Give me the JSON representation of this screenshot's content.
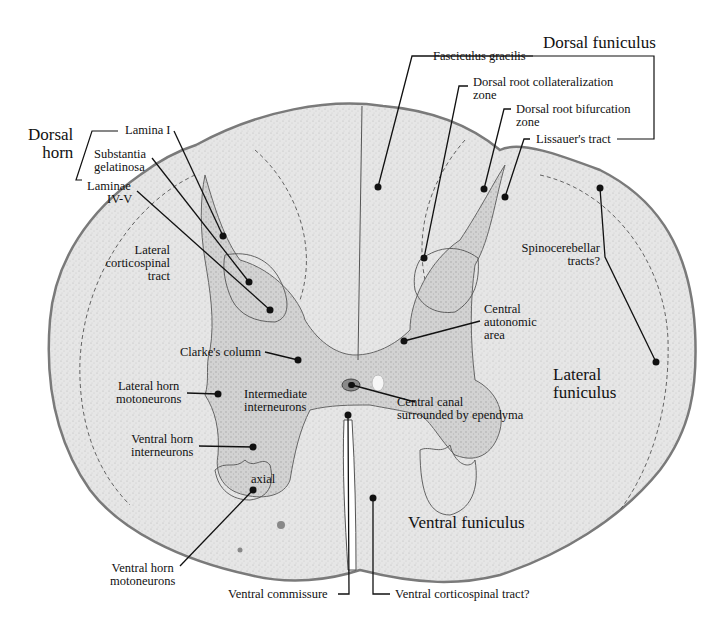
{
  "figure": {
    "type": "labeled histology diagram",
    "colors": {
      "tissue": "#e4e4e4",
      "tissue_edge": "#8a8a8a",
      "gray_matter": "#cfcfcf",
      "line": "#111111",
      "background": "#ffffff"
    }
  },
  "groups": {
    "dorsal_horn": [
      "Dorsal",
      "horn"
    ],
    "dorsal_funiculus": "Dorsal funiculus",
    "lateral_funiculus": [
      "Lateral",
      "funiculus"
    ],
    "ventral_funiculus": "Ventral funiculus"
  },
  "labels": {
    "lamina_i": "Lamina I",
    "substantia_gelatinosa": [
      "Substantia",
      "gelatinosa"
    ],
    "laminae_iv_v": [
      "Laminae",
      "IV-V"
    ],
    "lateral_corticospinal_tract": [
      "Lateral",
      "corticospinal",
      "tract"
    ],
    "fasciculus_gracilis": "Fasciculus gracilis",
    "dorsal_root_collateralization_zone": [
      "Dorsal root collateralization",
      "zone"
    ],
    "dorsal_root_bifurcation_zone": [
      "Dorsal root bifurcation",
      "zone"
    ],
    "lissauers_tract": "Lissauer's tract",
    "spinocerebellar_tracts": [
      "Spinocerebellar",
      "tracts?"
    ],
    "central_autonomic_area": [
      "Central",
      "autonomic",
      "area"
    ],
    "clarkes_column": "Clarke's column",
    "lateral_horn_motoneurons": [
      "Lateral horn",
      "motoneurons"
    ],
    "intermediate_interneurons": [
      "Intermediate",
      "interneurons"
    ],
    "central_canal": [
      "Central canal",
      "surrounded by ependyma"
    ],
    "ventral_horn_interneurons": [
      "Ventral horn",
      "interneurons"
    ],
    "axial": "axial",
    "ventral_horn_motoneurons": [
      "Ventral horn",
      "motoneurons"
    ],
    "ventral_commissure": "Ventral commissure",
    "ventral_corticospinal_tract": "Ventral corticospinal tract?"
  },
  "icons": {
    "pointer_dot": "filled-circle",
    "leader_line": "line"
  }
}
